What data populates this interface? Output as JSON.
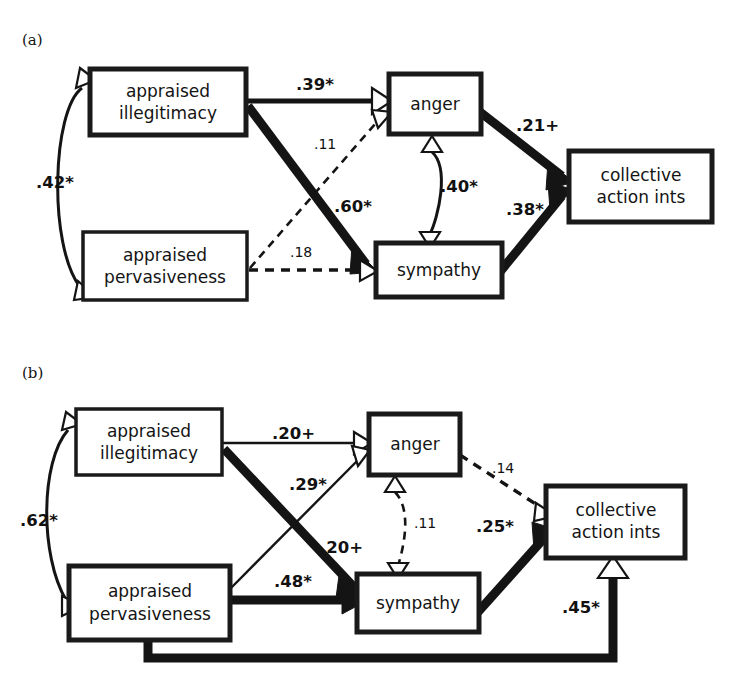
{
  "figure": {
    "type": "path-diagram",
    "panels": [
      {
        "tag": "(a)",
        "nodes": [
          {
            "id": "illegitimacy",
            "label_line1": "appraised",
            "label_line2": "illegitimacy"
          },
          {
            "id": "pervasiveness",
            "label_line1": "appraised",
            "label_line2": "pervasiveness"
          },
          {
            "id": "anger",
            "label_line1": "anger",
            "label_line2": ""
          },
          {
            "id": "sympathy",
            "label_line1": "sympathy",
            "label_line2": ""
          },
          {
            "id": "collective",
            "label_line1": "collective",
            "label_line2": "action ints"
          }
        ],
        "paths": [
          {
            "from": "illegitimacy",
            "to": "anger",
            "coef": ".39*",
            "style": "solid-thick",
            "significant": true
          },
          {
            "from": "illegitimacy",
            "to": "sympathy",
            "coef": ".60*",
            "style": "solid-thick",
            "significant": true
          },
          {
            "from": "pervasiveness",
            "to": "anger",
            "coef": ".11",
            "style": "dashed",
            "significant": false
          },
          {
            "from": "pervasiveness",
            "to": "sympathy",
            "coef": ".18",
            "style": "dashed",
            "significant": false
          },
          {
            "from": "anger",
            "to": "collective",
            "coef": ".21+",
            "style": "solid-thick",
            "significant": true
          },
          {
            "from": "sympathy",
            "to": "collective",
            "coef": ".38*",
            "style": "solid-thick",
            "significant": true
          },
          {
            "from": "illegitimacy",
            "to": "pervasiveness",
            "coef": ".42*",
            "style": "curved-double",
            "significant": true
          },
          {
            "from": "anger",
            "to": "sympathy",
            "coef": ".40*",
            "style": "curved-double",
            "significant": true
          }
        ]
      },
      {
        "tag": "(b)",
        "nodes": [
          {
            "id": "illegitimacy",
            "label_line1": "appraised",
            "label_line2": "illegitimacy"
          },
          {
            "id": "pervasiveness",
            "label_line1": "appraised",
            "label_line2": "pervasiveness"
          },
          {
            "id": "anger",
            "label_line1": "anger",
            "label_line2": ""
          },
          {
            "id": "sympathy",
            "label_line1": "sympathy",
            "label_line2": ""
          },
          {
            "id": "collective",
            "label_line1": "collective",
            "label_line2": "action ints"
          }
        ],
        "paths": [
          {
            "from": "illegitimacy",
            "to": "anger",
            "coef": ".20+",
            "style": "solid-thin",
            "significant": true
          },
          {
            "from": "illegitimacy",
            "to": "sympathy",
            "coef": ".20+",
            "style": "solid-thick",
            "significant": true
          },
          {
            "from": "pervasiveness",
            "to": "anger",
            "coef": ".29*",
            "style": "solid-thin",
            "significant": true
          },
          {
            "from": "pervasiveness",
            "to": "sympathy",
            "coef": ".48*",
            "style": "solid-thick",
            "significant": true
          },
          {
            "from": "anger",
            "to": "collective",
            "coef": ".14",
            "style": "dashed",
            "significant": false
          },
          {
            "from": "sympathy",
            "to": "collective",
            "coef": ".25*",
            "style": "solid-thick",
            "significant": true
          },
          {
            "from": "pervasiveness",
            "to": "collective",
            "coef": ".45*",
            "style": "solid-thick-elbow",
            "significant": true
          },
          {
            "from": "illegitimacy",
            "to": "pervasiveness",
            "coef": ".62*",
            "style": "curved-double",
            "significant": true
          },
          {
            "from": "anger",
            "to": "sympathy",
            "coef": ".11",
            "style": "curved-double-dashed",
            "significant": false
          }
        ]
      }
    ],
    "colors": {
      "ink": "#141414",
      "paper": "#ffffff"
    }
  }
}
